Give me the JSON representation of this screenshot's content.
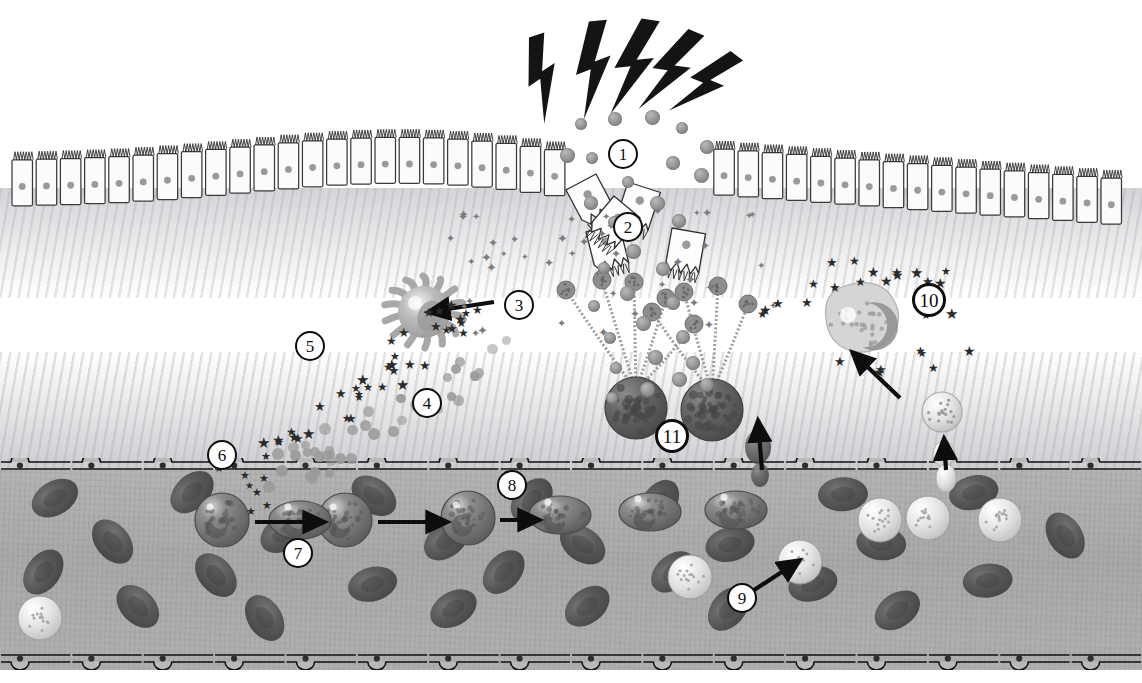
{
  "figure": {
    "type": "biomedical-schematic",
    "palette": {
      "ink": "#0d0d0d",
      "epithelium_fill": "#fbfbfb",
      "epithelium_stroke": "#3a3a3a",
      "nucleus": "#9a9a9a",
      "vessel_plasma": "#adadad",
      "rbc": "#555555",
      "granulocyte": "#6f6f6f",
      "mast_cell": "#5e5e5e",
      "eosinophil": "#c9c9c9",
      "background": "#ffffff"
    }
  },
  "callouts": [
    {
      "id": "1",
      "label": "1",
      "x": 608,
      "y": 139,
      "meaning": "allergen-inhalation"
    },
    {
      "id": "2",
      "label": "2",
      "x": 613,
      "y": 212,
      "meaning": "epithelial-barrier-damage"
    },
    {
      "id": "3",
      "label": "3",
      "x": 504,
      "y": 290,
      "meaning": "dendritic-cell-antigen-uptake"
    },
    {
      "id": "4",
      "label": "4",
      "x": 412,
      "y": 388,
      "meaning": "chemokine-gradient"
    },
    {
      "id": "5",
      "label": "5",
      "x": 295,
      "y": 331,
      "meaning": "cytokine-release"
    },
    {
      "id": "6",
      "label": "6",
      "x": 207,
      "y": 440,
      "meaning": "mediator-reaches-endothelium"
    },
    {
      "id": "7",
      "label": "7",
      "x": 283,
      "y": 538,
      "meaning": "leukocyte-rolling"
    },
    {
      "id": "8",
      "label": "8",
      "x": 497,
      "y": 470,
      "meaning": "adhesion-to-endothelium"
    },
    {
      "id": "9",
      "label": "9",
      "x": 727,
      "y": 583,
      "meaning": "eosinophil-activation"
    },
    {
      "id": "10",
      "label": "10",
      "x": 912,
      "y": 283,
      "meaning": "eosinophil-degranulation"
    },
    {
      "id": "11",
      "label": "11",
      "x": 655,
      "y": 419,
      "meaning": "mast-cell-ige-crosslinking"
    }
  ],
  "legend_items": [
    {
      "key": "lightning",
      "name": "irritant-trigger",
      "count": 5
    },
    {
      "key": "allergen-particle",
      "name": "allergen-particle"
    },
    {
      "key": "star-mediator",
      "name": "inflammatory-mediator"
    },
    {
      "key": "cytokine-square",
      "name": "cytokine-square"
    },
    {
      "key": "epithelial-cell",
      "name": "ciliated-epithelial-cell"
    },
    {
      "key": "detached-cell",
      "name": "detached-epithelial-cell"
    },
    {
      "key": "dendritic-cell",
      "name": "dendritic-cell"
    },
    {
      "key": "mast-cell",
      "name": "mast-cell"
    },
    {
      "key": "eosinophil",
      "name": "eosinophil"
    },
    {
      "key": "rbc",
      "name": "red-blood-cell"
    },
    {
      "key": "endothelium",
      "name": "endothelial-lining"
    }
  ],
  "structures": {
    "epithelium_label": "ciliated columnar epithelium",
    "vessel_label": "blood vessel lumen",
    "mucosa_label": "submucosa",
    "epithelial_cell_count": 46,
    "endothelial_cell_count": 16
  },
  "counts": {
    "lightning_bolts": 5,
    "detached_epithelial_cells": 5,
    "mast_cells": 2,
    "dendritic_cells": 1,
    "eosinophils_in_tissue": 1,
    "granulocytes_in_vessel": 7,
    "red_blood_cells": 27
  }
}
